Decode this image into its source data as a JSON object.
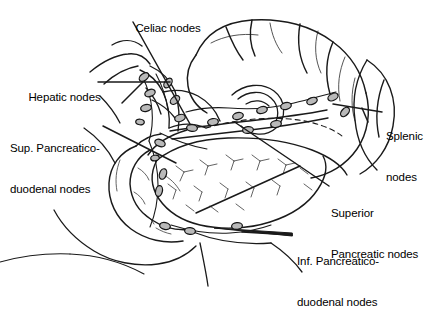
{
  "figure": {
    "type": "anatomical-line-drawing",
    "background_color": "#ffffff",
    "ink_color": "#1a1a1a",
    "node_fill_color": "#b9b9b9",
    "node_outline_color": "#1a1a1a"
  },
  "labels": [
    {
      "id": "celiac",
      "text": "Celiac nodes",
      "lines": [
        "Celiac nodes"
      ],
      "x": 123,
      "y": 8,
      "align": "left"
    },
    {
      "id": "hepatic",
      "text": "Hepatic nodes",
      "lines": [
        "Hepatic nodes"
      ],
      "x": 16,
      "y": 77,
      "align": "left"
    },
    {
      "id": "suppd",
      "text": "Sup. Pancreatico-duodenal nodes",
      "lines": [
        "Sup. Pancreatico-",
        "duodenal nodes"
      ],
      "x": 10,
      "y": 115,
      "align": "left"
    },
    {
      "id": "splenic",
      "text": "Splenic nodes",
      "lines": [
        "Splenic",
        "nodes"
      ],
      "x": 386,
      "y": 103,
      "align": "left"
    },
    {
      "id": "suppanc",
      "text": "Superior Pancreatic nodes",
      "lines": [
        "Superior",
        "Pancreatic nodes"
      ],
      "x": 331,
      "y": 180,
      "align": "left"
    },
    {
      "id": "infpd",
      "text": "Inf. Pancreatico-duodenal nodes",
      "lines": [
        "Inf. Pancreatico-",
        "duodenal nodes"
      ],
      "x": 297,
      "y": 228,
      "align": "left"
    }
  ],
  "organs": [
    {
      "name": "stomach"
    },
    {
      "name": "pancreas"
    },
    {
      "name": "duodenum"
    },
    {
      "name": "spleen"
    },
    {
      "name": "celiac-trunk"
    }
  ],
  "node_groups": [
    {
      "name": "celiac-nodes",
      "count": 4
    },
    {
      "name": "hepatic-nodes",
      "count": 4
    },
    {
      "name": "superior-pancreaticoduodenal-nodes",
      "count": 4
    },
    {
      "name": "splenic-nodes",
      "count": 3
    },
    {
      "name": "superior-pancreatic-nodes",
      "count": 6
    },
    {
      "name": "inferior-pancreaticoduodenal-nodes",
      "count": 3
    }
  ]
}
